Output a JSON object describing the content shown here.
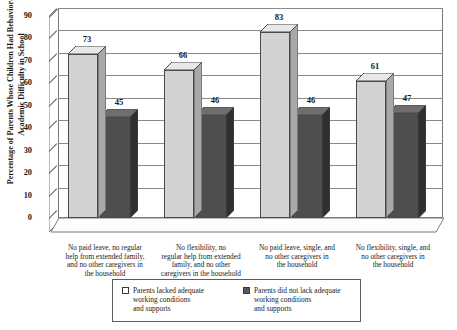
{
  "chart_data": {
    "type": "bar",
    "title": "",
    "xlabel": "",
    "ylabel": "Percentage of Parents Whose Children Had Behavioral or Academic Difficulty in School",
    "ylim": [
      0,
      90
    ],
    "yticks": [
      0,
      10,
      20,
      30,
      40,
      50,
      60,
      70,
      80,
      90
    ],
    "grid": true,
    "legend_position": "bottom",
    "categories": [
      "No paid leave, no regular help from extended family, and no other caregivers in the household",
      "No flexibility, no regular help from extended family, and no other caregivers in the household",
      "No paid leave, single, and no other caregivers in the household",
      "No flexibility, single, and no other caregivers in the household"
    ],
    "series": [
      {
        "name": "Parents lacked adequate working conditions and supports",
        "color": "#d2d2d2",
        "values": [
          73,
          66,
          83,
          61
        ]
      },
      {
        "name": "Parents did not lack adequate working conditions and supports",
        "color": "#4e4e4e",
        "values": [
          45,
          46,
          46,
          47
        ]
      }
    ]
  },
  "legend": {
    "items": [
      {
        "label_line1": "Parents lacked adequate",
        "label_line2": "working conditions",
        "label_line3": "and supports"
      },
      {
        "label_line1": "Parents did not lack adequate",
        "label_line2": "working conditions",
        "label_line3": "and supports"
      }
    ]
  },
  "axis": {
    "ticks": [
      "0",
      "10",
      "20",
      "30",
      "40",
      "50",
      "60",
      "70",
      "80",
      "90"
    ]
  },
  "categories_wrapped": [
    [
      "No paid leave, no regular",
      "help from extended family,",
      "and no other caregivers in",
      "the household"
    ],
    [
      "No flexibility, no",
      "regular help from extended",
      "family, and no other",
      "caregivers in the household"
    ],
    [
      "No paid leave, single, and",
      "no other caregivers in",
      "the household"
    ],
    [
      "No flexibility, single, and",
      "no other caregivers in",
      "the household"
    ]
  ]
}
